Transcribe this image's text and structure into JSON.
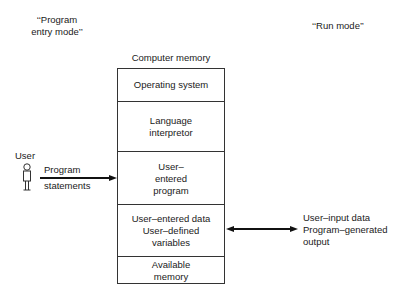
{
  "modes": {
    "program_entry": "‘‘Program\nentry mode’’",
    "program_entry_line1": "‘‘Program",
    "program_entry_line2": "entry mode’’",
    "run": "‘‘Run mode’’"
  },
  "memory": {
    "title": "Computer memory",
    "segments": [
      {
        "lines": [
          "Operating system"
        ]
      },
      {
        "lines": [
          "Language",
          "interpretor"
        ]
      },
      {
        "lines": [
          "User–",
          "entered",
          "program"
        ]
      },
      {
        "lines": [
          "User–entered data",
          "User–defined",
          "variables"
        ]
      },
      {
        "lines": [
          "Available",
          "memory"
        ]
      }
    ]
  },
  "user": {
    "label": "User",
    "icon": "person-icon"
  },
  "left_arrow": {
    "line1": "Program",
    "line2": "statements"
  },
  "right_arrow": {
    "line1": "User–input data",
    "line2": "Program–generated",
    "line3": "output"
  }
}
